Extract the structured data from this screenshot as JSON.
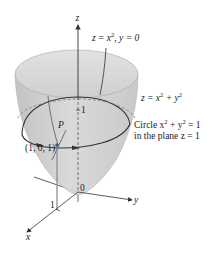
{
  "diagram": {
    "colors": {
      "surface_fill": "#c9c9c9",
      "surface_rim": "#dcdcdc",
      "line": "#333333",
      "axis": "#333333",
      "background": "#ffffff"
    },
    "labels": {
      "z_axis": "z",
      "y_axis": "y",
      "x_axis": "x",
      "origin": "0",
      "x_tick": "1",
      "z_tick": "1",
      "point_name": "P",
      "point_coords": "(1, 0, 1)",
      "trace_eq": {
        "pre": "z = x",
        "sup": "2",
        "post": ", y = 0"
      },
      "surface_eq": {
        "pre": "z = x",
        "sup1": "2",
        "mid": " + y",
        "sup2": "2"
      },
      "circle_line1": {
        "pre": "Circle x",
        "sup1": "2",
        "mid": " + y",
        "sup2": "2",
        "post": " = 1"
      },
      "circle_line2": "in the plane z = 1"
    }
  }
}
